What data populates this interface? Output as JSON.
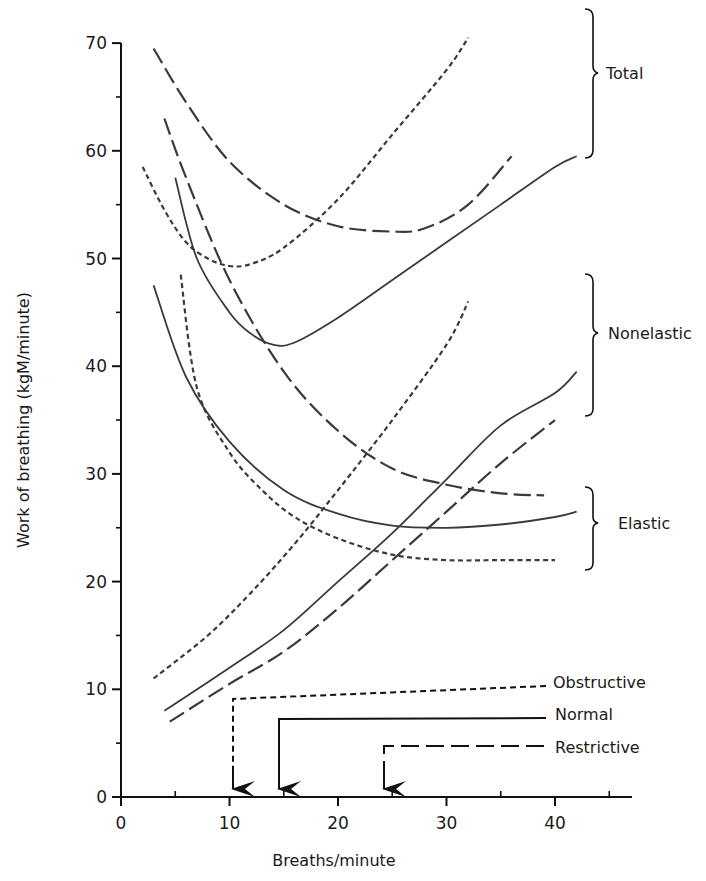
{
  "chart_data": {
    "type": "line",
    "title": "",
    "xlabel": "Breaths/minute",
    "ylabel": "Work of breathing  (kgM/minute)",
    "xlim": [
      0,
      46
    ],
    "ylim": [
      0,
      70
    ],
    "x_ticks": [
      0,
      10,
      20,
      30,
      40
    ],
    "x_minor_ticks": [
      5,
      15,
      25,
      35,
      45
    ],
    "y_ticks": [
      0,
      10,
      20,
      30,
      40,
      50,
      60,
      70
    ],
    "y_minor_ticks": [
      5,
      15,
      25,
      35,
      45,
      55,
      65
    ],
    "grid": false,
    "line_styles": {
      "Normal": "solid",
      "Obstructive": "short-dash",
      "Restrictive": "long-dash"
    },
    "groups": [
      {
        "name": "Total",
        "y_range": [
          59,
          73
        ]
      },
      {
        "name": "Nonelastic",
        "y_range": [
          35,
          48.5
        ]
      },
      {
        "name": "Elastic",
        "y_range": [
          21,
          29
        ]
      }
    ],
    "series": [
      {
        "name": "Total - Normal",
        "group": "Total",
        "style": "solid",
        "x": [
          5,
          7,
          10,
          12,
          14,
          16,
          20,
          25,
          30,
          35,
          40,
          42
        ],
        "y": [
          57.5,
          50,
          45,
          43,
          42,
          42.2,
          44.5,
          48,
          51.5,
          55,
          58.5,
          59.5
        ]
      },
      {
        "name": "Total - Obstructive",
        "group": "Total",
        "style": "short-dash",
        "x": [
          2,
          4,
          6,
          8,
          10,
          12,
          15,
          20,
          25,
          30,
          32
        ],
        "y": [
          58.5,
          54.5,
          51.5,
          50,
          49.3,
          49.5,
          51,
          55.5,
          61.5,
          67.5,
          70.5
        ]
      },
      {
        "name": "Total - Restrictive",
        "group": "Total",
        "style": "long-dash",
        "x": [
          3,
          6,
          10,
          15,
          20,
          25,
          28,
          32,
          36
        ],
        "y": [
          69.5,
          64.5,
          59,
          55,
          53,
          52.5,
          52.8,
          55,
          59.5
        ]
      },
      {
        "name": "Nonelastic - Normal",
        "group": "Nonelastic",
        "style": "solid",
        "x": [
          4,
          10,
          15,
          20,
          25,
          30,
          35,
          40,
          42
        ],
        "y": [
          8,
          12,
          15.5,
          20,
          24.5,
          29.5,
          34.5,
          37.5,
          39.5
        ]
      },
      {
        "name": "Nonelastic - Obstructive",
        "group": "Nonelastic",
        "style": "short-dash",
        "x": [
          3,
          8,
          12,
          16,
          20,
          25,
          30,
          32
        ],
        "y": [
          11,
          15,
          19,
          23.5,
          28.5,
          35,
          42,
          46
        ]
      },
      {
        "name": "Nonelastic - Restrictive",
        "group": "Nonelastic",
        "style": "long-dash",
        "x": [
          4.5,
          10,
          15,
          20,
          25,
          30,
          35,
          40
        ],
        "y": [
          7,
          10.5,
          13.5,
          17.5,
          22,
          26.5,
          31,
          35
        ]
      },
      {
        "name": "Elastic - Normal",
        "group": "Elastic",
        "style": "solid",
        "x": [
          3,
          6,
          10,
          15,
          20,
          25,
          30,
          35,
          40,
          42
        ],
        "y": [
          47.5,
          39,
          33,
          28.5,
          26.3,
          25.2,
          25,
          25.3,
          26,
          26.5
        ]
      },
      {
        "name": "Elastic - Obstructive",
        "group": "Elastic",
        "style": "short-dash",
        "x": [
          5.5,
          7,
          10,
          13,
          16,
          20,
          25,
          30,
          35,
          40
        ],
        "y": [
          48.5,
          38,
          32,
          28.5,
          26,
          24,
          22.5,
          22,
          22,
          22
        ]
      },
      {
        "name": "Elastic - Restrictive",
        "group": "Elastic",
        "style": "long-dash",
        "x": [
          4,
          6,
          10,
          15,
          20,
          25,
          30,
          35,
          39
        ],
        "y": [
          63,
          57.5,
          48,
          39.5,
          34,
          30.5,
          29,
          28.2,
          28
        ]
      }
    ],
    "annotations": [
      {
        "label": "Obstructive",
        "style": "short-dash",
        "arrow_x": 10
      },
      {
        "label": "Normal",
        "style": "solid",
        "arrow_x": 14.5
      },
      {
        "label": "Restrictive",
        "style": "long-dash",
        "arrow_x": 24.5
      }
    ]
  },
  "labels": {
    "x_axis_title": "Breaths/minute",
    "y_axis_title": "Work of breathing  (kgM/minute)",
    "brace_total": "Total",
    "brace_nonelastic": "Nonelastic",
    "brace_elastic": "Elastic",
    "legend_obstructive": "Obstructive",
    "legend_normal": "Normal",
    "legend_restrictive": "Restrictive"
  }
}
